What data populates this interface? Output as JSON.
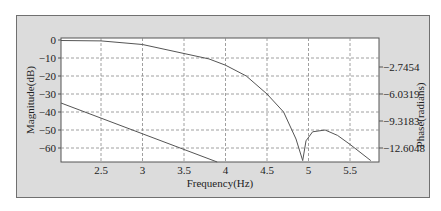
{
  "chart_data": {
    "type": "line",
    "title": "",
    "xlabel": "Frequency(Hz)",
    "ylabel": "Magnitude(dB)",
    "y2label": "Phase(radians)",
    "xlim": [
      2.05,
      5.8
    ],
    "ylim": [
      -67,
      1
    ],
    "x_ticks": [
      "2.5",
      "3",
      "3.5",
      "4",
      "4.5",
      "5",
      "5.5"
    ],
    "y_ticks": [
      "0",
      "-10",
      "-20",
      "-30",
      "-40",
      "-50",
      "-60"
    ],
    "y2_ticks": [
      "-2.7454",
      "-6.0319",
      "-9.3183",
      "-12.6048"
    ],
    "grid": true,
    "series": [
      {
        "name": "Magnitude",
        "axis": "left",
        "x": [
          2.05,
          2.5,
          3.0,
          3.5,
          3.8,
          4.0,
          4.25,
          4.5,
          4.7,
          4.85,
          4.93,
          4.97,
          5.05,
          5.2,
          5.35,
          5.5,
          5.75
        ],
        "y": [
          -0.3,
          -0.5,
          -2.5,
          -7.5,
          -10.5,
          -14,
          -20,
          -30,
          -40,
          -55,
          -67,
          -56,
          -51,
          -50,
          -53,
          -58,
          -67
        ]
      },
      {
        "name": "Phase",
        "axis": "right",
        "x": [
          2.05,
          3.9
        ],
        "y_pixel_note": "linear decreasing from left edge to bottom",
        "y": [
          -35,
          -67
        ]
      }
    ],
    "grid_style": "dashed",
    "legend": null
  },
  "labels": {
    "xlabel": "Frequency(Hz)",
    "ylabel": "Magnitude(dB)",
    "y2label": "Phase(radians)"
  },
  "colors": {
    "panel": "#dcdcdc",
    "plot_bg": "#ffffff",
    "line": "#555555",
    "grid": "#888888"
  }
}
